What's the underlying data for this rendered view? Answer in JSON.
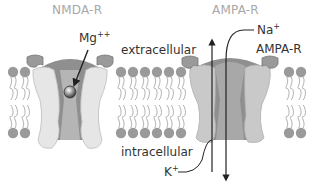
{
  "diagram": {
    "titles": {
      "left": "NMDA-R",
      "right": "AMPA-R"
    },
    "labels": {
      "mg": "Mg",
      "mg_charge": "++",
      "extracellular": "extracellular",
      "intracellular": "intracellular",
      "na": "Na",
      "na_charge": "+",
      "ampa_label": "AMPA-R",
      "k": "K",
      "k_charge": "+"
    },
    "colors": {
      "title_gray": "#a8a8a8",
      "text": "#333333",
      "lipid_head": "#9a9a9a",
      "lipid_tail": "#b0b0b0",
      "receptor_light": "#e6e6e6",
      "receptor_mid": "#bcbcbc",
      "receptor_dark": "#8f8f8f",
      "cap": "#9a9a9a",
      "arrow": "#222222"
    }
  }
}
